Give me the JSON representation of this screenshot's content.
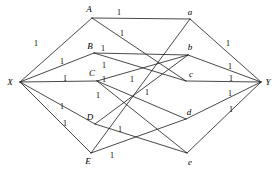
{
  "figure": {
    "type": "bipartite-assignment-network",
    "width": 279,
    "height": 172,
    "background": "#ffffff",
    "stroke_color": "#1a1a1a"
  },
  "nodes": [
    {
      "id": "X",
      "label": "X",
      "lx": 10,
      "ly": 82,
      "px": 20,
      "py": 82
    },
    {
      "id": "A",
      "label": "A",
      "lx": 89,
      "ly": 9,
      "px": 92,
      "py": 18
    },
    {
      "id": "B",
      "label": "B",
      "lx": 90,
      "ly": 46,
      "px": 94,
      "py": 53
    },
    {
      "id": "C",
      "label": "C",
      "lx": 92,
      "ly": 73,
      "px": 97,
      "py": 81
    },
    {
      "id": "D",
      "label": "D",
      "lx": 90,
      "ly": 117,
      "px": 95,
      "py": 124
    },
    {
      "id": "E",
      "label": "E",
      "lx": 88,
      "ly": 161,
      "px": 91,
      "py": 153
    },
    {
      "id": "a",
      "label": "a",
      "lx": 190,
      "ly": 12,
      "px": 190,
      "py": 19
    },
    {
      "id": "b",
      "label": "b",
      "lx": 190,
      "ly": 47,
      "px": 188,
      "py": 55
    },
    {
      "id": "c",
      "label": "c",
      "lx": 191,
      "ly": 74,
      "px": 186,
      "py": 81
    },
    {
      "id": "d",
      "label": "d",
      "lx": 189,
      "ly": 112,
      "px": 186,
      "py": 119
    },
    {
      "id": "e",
      "label": "e",
      "lx": 190,
      "ly": 162,
      "px": 187,
      "py": 153
    },
    {
      "id": "Y",
      "label": "Y",
      "lx": 268,
      "ly": 82,
      "px": 261,
      "py": 82
    }
  ],
  "edges": [
    {
      "from": "X",
      "to": "A"
    },
    {
      "from": "X",
      "to": "B"
    },
    {
      "from": "X",
      "to": "C"
    },
    {
      "from": "X",
      "to": "D"
    },
    {
      "from": "X",
      "to": "E"
    },
    {
      "from": "A",
      "to": "a"
    },
    {
      "from": "A",
      "to": "c"
    },
    {
      "from": "B",
      "to": "b"
    },
    {
      "from": "B",
      "to": "c"
    },
    {
      "from": "C",
      "to": "b"
    },
    {
      "from": "C",
      "to": "d"
    },
    {
      "from": "C",
      "to": "e"
    },
    {
      "from": "D",
      "to": "b"
    },
    {
      "from": "D",
      "to": "e"
    },
    {
      "from": "E",
      "to": "a"
    },
    {
      "from": "E",
      "to": "d"
    },
    {
      "from": "a",
      "to": "Y"
    },
    {
      "from": "b",
      "to": "Y"
    },
    {
      "from": "c",
      "to": "Y"
    },
    {
      "from": "d",
      "to": "Y"
    },
    {
      "from": "e",
      "to": "Y"
    }
  ],
  "edge_labels": [
    {
      "text": "1",
      "x": 36,
      "y": 44,
      "for": "X-A"
    },
    {
      "text": "1",
      "x": 62,
      "y": 62,
      "for": "X-B"
    },
    {
      "text": "1",
      "x": 65,
      "y": 79,
      "for": "X-C"
    },
    {
      "text": "1",
      "x": 62,
      "y": 107,
      "for": "X-D"
    },
    {
      "text": "1",
      "x": 65,
      "y": 124,
      "for": "X-E"
    },
    {
      "text": "1",
      "x": 119,
      "y": 13,
      "for": "A-a"
    },
    {
      "text": "1",
      "x": 122,
      "y": 34,
      "for": "A-c"
    },
    {
      "text": "1",
      "x": 103,
      "y": 49,
      "for": "B-b"
    },
    {
      "text": "1",
      "x": 104,
      "y": 66,
      "for": "B-c"
    },
    {
      "text": "1",
      "x": 104,
      "y": 80,
      "for": "C-b"
    },
    {
      "text": "1",
      "x": 132,
      "y": 80,
      "for": "C-d"
    },
    {
      "text": "1",
      "x": 98,
      "y": 96,
      "for": "C-e"
    },
    {
      "text": "1",
      "x": 147,
      "y": 93,
      "for": "D-b"
    },
    {
      "text": "1",
      "x": 120,
      "y": 130,
      "for": "D-e"
    },
    {
      "text": "1",
      "x": 112,
      "y": 156,
      "for": "E-a"
    },
    {
      "text": "1",
      "x": 228,
      "y": 44,
      "for": "a-Y"
    },
    {
      "text": "1",
      "x": 230,
      "y": 67,
      "for": "b-Y"
    },
    {
      "text": "1",
      "x": 231,
      "y": 79,
      "for": "c-Y"
    },
    {
      "text": "1",
      "x": 230,
      "y": 94,
      "for": "d-Y"
    },
    {
      "text": "1",
      "x": 231,
      "y": 110,
      "for": "e-Y"
    }
  ]
}
